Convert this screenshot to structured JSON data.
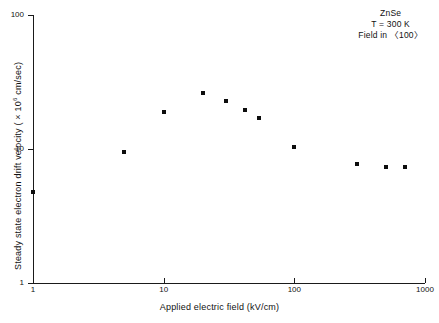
{
  "chart_data": {
    "type": "scatter",
    "title": "",
    "xlabel": "Applied electric field (kV/cm)",
    "ylabel_prefix": "Steady state electron drift velocity ( × 10",
    "ylabel_exponent": "6",
    "ylabel_suffix": " cm/sec)",
    "xscale": "log",
    "yscale": "log",
    "xlim": [
      1,
      1000
    ],
    "ylim": [
      1,
      100
    ],
    "xticks": [
      1,
      10,
      100,
      1000
    ],
    "xtick_labels": [
      "1",
      "10",
      "100",
      "1000"
    ],
    "yticks": [
      1,
      10,
      100
    ],
    "ytick_labels": [
      "1",
      "10",
      "100"
    ],
    "grid": false,
    "legend": "none",
    "marker": "square",
    "marker_color": "#0d0d0d",
    "x": [
      1,
      5,
      10,
      20,
      30,
      42,
      54,
      100,
      300,
      500,
      700
    ],
    "y": [
      4.8,
      9.5,
      19.0,
      26.0,
      23.0,
      19.5,
      17.0,
      10.3,
      7.7,
      7.4,
      7.4
    ],
    "points": [
      {
        "x": 1,
        "y": 4.8
      },
      {
        "x": 5,
        "y": 9.5
      },
      {
        "x": 10,
        "y": 19.0
      },
      {
        "x": 20,
        "y": 26.0
      },
      {
        "x": 30,
        "y": 23.0
      },
      {
        "x": 42,
        "y": 19.5
      },
      {
        "x": 54,
        "y": 17.0
      },
      {
        "x": 100,
        "y": 10.3
      },
      {
        "x": 300,
        "y": 7.7
      },
      {
        "x": 500,
        "y": 7.4
      },
      {
        "x": 700,
        "y": 7.4
      }
    ],
    "annotations": [
      "ZnSe",
      "T = 300 K",
      "Field in 〈100〉"
    ]
  },
  "axis_color": "#1a1a1a"
}
